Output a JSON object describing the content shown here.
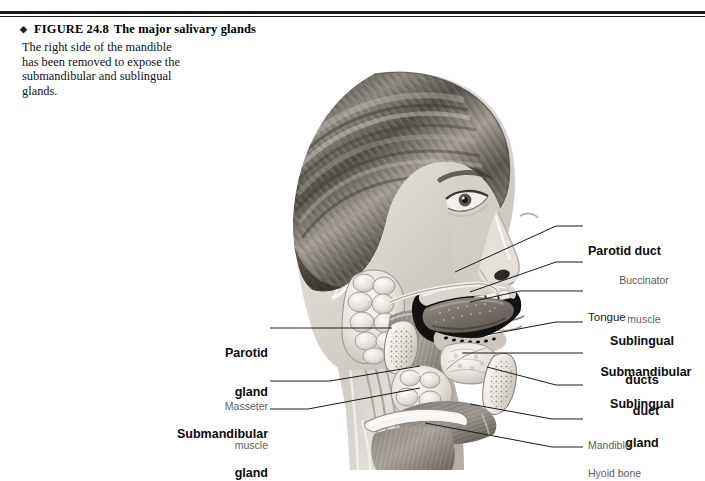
{
  "figure": {
    "bullet": "◆",
    "number": "FIGURE 24.8",
    "title": "The major salivary glands",
    "caption": "The right side of the mandible has been removed to expose the submandibular and sublingual glands."
  },
  "rules": {
    "top_color": "#1b1b1b",
    "bottom_color": "#1b1b1b"
  },
  "colors": {
    "background": "#ffffff",
    "major_label": "#0b0b0b",
    "minor_label": "#5d5d5d",
    "leader_line": "#1a1a1a"
  },
  "labels": {
    "left": [
      {
        "id": "parotid-gland",
        "emphasis": "major",
        "line1": "Parotid",
        "line2": "gland"
      },
      {
        "id": "masseter-muscle",
        "emphasis": "minor",
        "line1": "Masseter",
        "line2": "muscle"
      },
      {
        "id": "submandibular-gland",
        "emphasis": "major",
        "line1": "Submandibular",
        "line2": "gland"
      }
    ],
    "right": [
      {
        "id": "parotid-duct",
        "emphasis": "major",
        "line1": "Parotid duct",
        "line2": ""
      },
      {
        "id": "buccinator-muscle",
        "emphasis": "minor",
        "line1": "Buccinator",
        "line2": "muscle"
      },
      {
        "id": "tongue",
        "emphasis": "mid",
        "line1": "Tongue",
        "line2": ""
      },
      {
        "id": "sublingual-ducts",
        "emphasis": "major",
        "line1": "Sublingual",
        "line2": "ducts"
      },
      {
        "id": "submandibular-duct",
        "emphasis": "major",
        "line1": "Submandibular",
        "line2": "duct"
      },
      {
        "id": "sublingual-gland",
        "emphasis": "major",
        "line1": "Sublingual",
        "line2": "gland"
      },
      {
        "id": "mandible",
        "emphasis": "minor",
        "line1": "Mandible",
        "line2": ""
      },
      {
        "id": "hyoid-bone",
        "emphasis": "minor",
        "line1": "Hyoid bone",
        "line2": ""
      }
    ]
  },
  "illustration": {
    "subject": "lateral view of a child's head and neck with right mandible removed",
    "structures": [
      "hair",
      "ear",
      "face",
      "eye",
      "nose",
      "lips",
      "parotid gland",
      "parotid duct",
      "masseter muscle",
      "buccinator muscle",
      "tongue",
      "sublingual gland",
      "sublingual ducts",
      "submandibular gland",
      "submandibular duct",
      "mandible cross-section",
      "hyoid bone",
      "neck muscles"
    ]
  }
}
